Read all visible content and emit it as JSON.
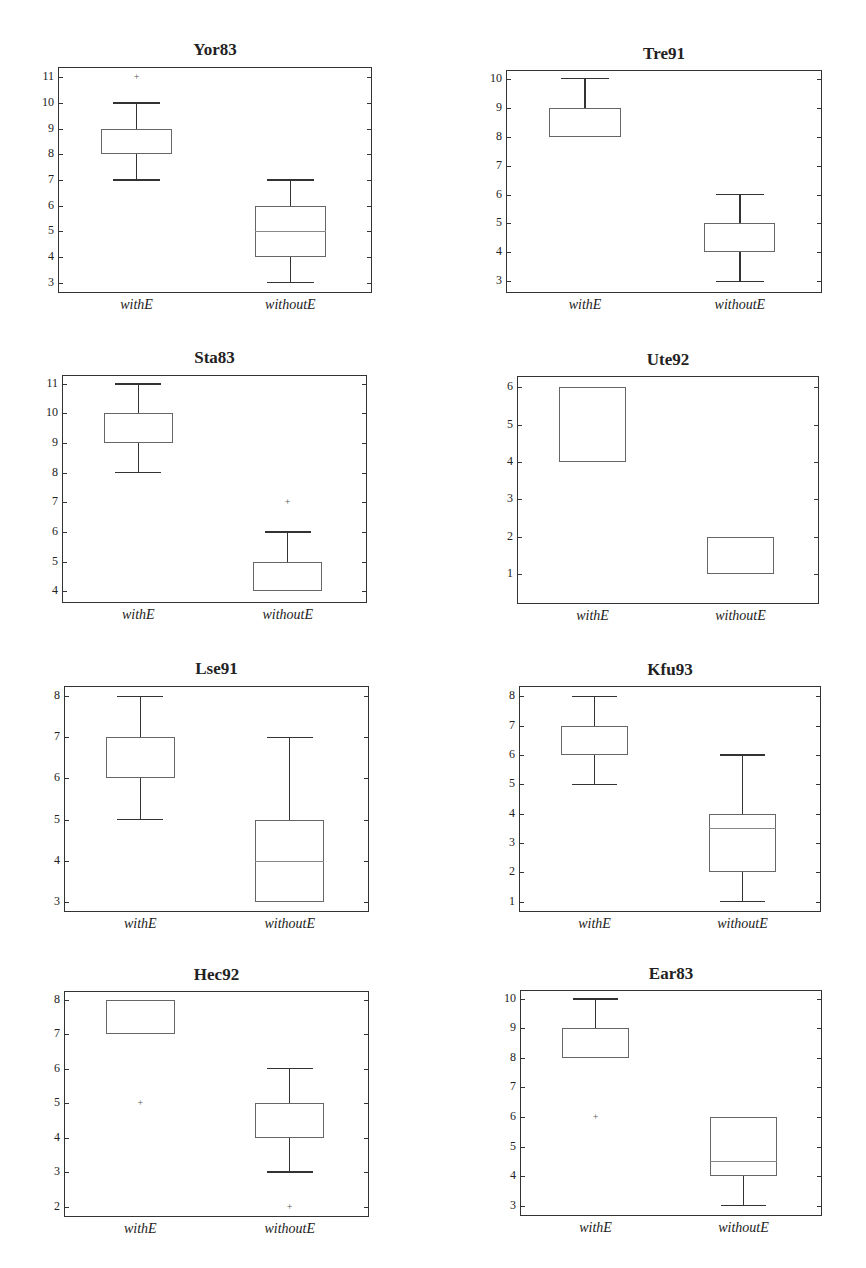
{
  "chart_data": [
    {
      "type": "box",
      "title": "Yor83",
      "categories": [
        "withE",
        "withoutE"
      ],
      "ylim": [
        2.6,
        11.4
      ],
      "yticks": [
        3,
        4,
        5,
        6,
        7,
        8,
        9,
        10,
        11
      ],
      "series": [
        {
          "name": "withE",
          "whisker_low": 7,
          "q1": 8,
          "median": 8,
          "q3": 9,
          "whisker_high": 10,
          "outliers": [
            11
          ]
        },
        {
          "name": "withoutE",
          "whisker_low": 3,
          "q1": 4,
          "median": 5,
          "q3": 6,
          "whisker_high": 7,
          "outliers": []
        }
      ]
    },
    {
      "type": "box",
      "title": "Tre91",
      "categories": [
        "withE",
        "withoutE"
      ],
      "ylim": [
        2.6,
        10.3
      ],
      "yticks": [
        3,
        4,
        5,
        6,
        7,
        8,
        9,
        10
      ],
      "series": [
        {
          "name": "withE",
          "whisker_low": 8,
          "q1": 8,
          "median": 8,
          "q3": 9,
          "whisker_high": 10,
          "outliers": []
        },
        {
          "name": "withoutE",
          "whisker_low": 3,
          "q1": 4,
          "median": 4,
          "q3": 5,
          "whisker_high": 6,
          "outliers": []
        }
      ]
    },
    {
      "type": "box",
      "title": "Sta83",
      "categories": [
        "withE",
        "withoutE"
      ],
      "ylim": [
        3.6,
        11.3
      ],
      "yticks": [
        4,
        5,
        6,
        7,
        8,
        9,
        10,
        11
      ],
      "series": [
        {
          "name": "withE",
          "whisker_low": 8,
          "q1": 9,
          "median": 9,
          "q3": 10,
          "whisker_high": 11,
          "outliers": []
        },
        {
          "name": "withoutE",
          "whisker_low": 4,
          "q1": 4,
          "median": 4,
          "q3": 5,
          "whisker_high": 6,
          "outliers": [
            7
          ]
        }
      ]
    },
    {
      "type": "box",
      "title": "Ute92",
      "categories": [
        "withE",
        "withoutE"
      ],
      "ylim": [
        0.2,
        6.3
      ],
      "yticks": [
        1,
        2,
        3,
        4,
        5,
        6
      ],
      "series": [
        {
          "name": "withE",
          "whisker_low": 4,
          "q1": 4,
          "median": 4,
          "q3": 6,
          "whisker_high": 6,
          "outliers": []
        },
        {
          "name": "withoutE",
          "whisker_low": 1,
          "q1": 1,
          "median": 1,
          "q3": 2,
          "whisker_high": 2,
          "outliers": []
        }
      ]
    },
    {
      "type": "box",
      "title": "Lse91",
      "categories": [
        "withE",
        "withoutE"
      ],
      "ylim": [
        2.75,
        8.25
      ],
      "yticks": [
        3,
        4,
        5,
        6,
        7,
        8
      ],
      "series": [
        {
          "name": "withE",
          "whisker_low": 5,
          "q1": 6,
          "median": 6,
          "q3": 7,
          "whisker_high": 8,
          "outliers": []
        },
        {
          "name": "withoutE",
          "whisker_low": 3,
          "q1": 3,
          "median": 4,
          "q3": 5,
          "whisker_high": 7,
          "outliers": []
        }
      ]
    },
    {
      "type": "box",
      "title": "Kfu93",
      "categories": [
        "withE",
        "withoutE"
      ],
      "ylim": [
        0.65,
        8.35
      ],
      "yticks": [
        1,
        2,
        3,
        4,
        5,
        6,
        7,
        8
      ],
      "series": [
        {
          "name": "withE",
          "whisker_low": 5,
          "q1": 6,
          "median": 6,
          "q3": 7,
          "whisker_high": 8,
          "outliers": []
        },
        {
          "name": "withoutE",
          "whisker_low": 1,
          "q1": 2,
          "median": 3.5,
          "q3": 4,
          "whisker_high": 6,
          "outliers": []
        }
      ]
    },
    {
      "type": "box",
      "title": "Hec92",
      "categories": [
        "withE",
        "withoutE"
      ],
      "ylim": [
        1.7,
        8.25
      ],
      "yticks": [
        2,
        3,
        4,
        5,
        6,
        7,
        8
      ],
      "series": [
        {
          "name": "withE",
          "whisker_low": 7,
          "q1": 7,
          "median": 7,
          "q3": 8,
          "whisker_high": 8,
          "outliers": [
            5
          ]
        },
        {
          "name": "withoutE",
          "whisker_low": 3,
          "q1": 4,
          "median": 4,
          "q3": 5,
          "whisker_high": 6,
          "outliers": [
            2
          ]
        }
      ]
    },
    {
      "type": "box",
      "title": "Ear83",
      "categories": [
        "withE",
        "withoutE"
      ],
      "ylim": [
        2.65,
        10.3
      ],
      "yticks": [
        3,
        4,
        5,
        6,
        7,
        8,
        9,
        10
      ],
      "series": [
        {
          "name": "withE",
          "whisker_low": 8,
          "q1": 8,
          "median": 8,
          "q3": 9,
          "whisker_high": 10,
          "outliers": [
            6
          ]
        },
        {
          "name": "withoutE",
          "whisker_low": 3,
          "q1": 4,
          "median": 4.5,
          "q3": 6,
          "whisker_high": 6,
          "outliers": []
        }
      ]
    }
  ],
  "panels": [
    {
      "title": "Yor83",
      "xlabels": [
        "withE",
        "withoutE"
      ]
    },
    {
      "title": "Tre91",
      "xlabels": [
        "withE",
        "withoutE"
      ]
    },
    {
      "title": "Sta83",
      "xlabels": [
        "withE",
        "withoutE"
      ]
    },
    {
      "title": "Ute92",
      "xlabels": [
        "withE",
        "withoutE"
      ]
    },
    {
      "title": "Lse91",
      "xlabels": [
        "withE",
        "withoutE"
      ]
    },
    {
      "title": "Kfu93",
      "xlabels": [
        "withE",
        "withoutE"
      ]
    },
    {
      "title": "Hec92",
      "xlabels": [
        "withE",
        "withoutE"
      ]
    },
    {
      "title": "Ear83",
      "xlabels": [
        "withE",
        "withoutE"
      ]
    }
  ]
}
